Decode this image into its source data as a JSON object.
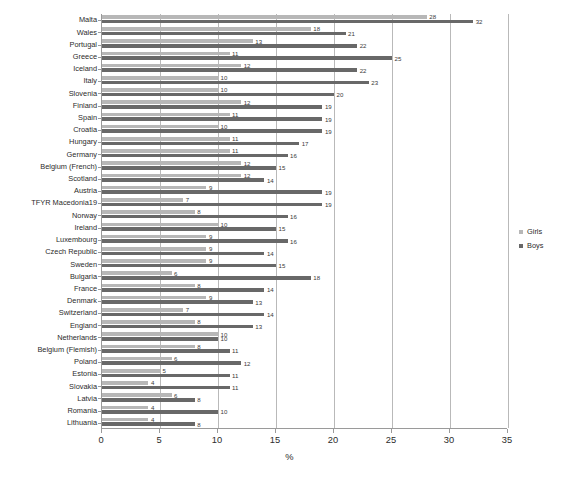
{
  "chart_data": {
    "type": "bar",
    "orientation": "horizontal",
    "title": "",
    "xlabel": "%",
    "ylabel": "",
    "xlim": [
      0,
      35
    ],
    "xticks": [
      0,
      5,
      10,
      15,
      20,
      25,
      30,
      35
    ],
    "grid": true,
    "legend_position": "right",
    "legend": [
      "Girls",
      "Boys"
    ],
    "categories": [
      "Malta",
      "Wales",
      "Portugal",
      "Greece",
      "Iceland",
      "Italy",
      "Slovenia",
      "Finland",
      "Spain",
      "Croatia",
      "Hungary",
      "Germany",
      "Belgium (French)",
      "Scotland",
      "Austria",
      "TFYR Macedonia19",
      "Norway",
      "Ireland",
      "Luxembourg",
      "Czech Republic",
      "Sweden",
      "Bulgaria",
      "France",
      "Denmark",
      "Switzerland",
      "England",
      "Netherlands",
      "Belgium (Flemish)",
      "Poland",
      "Estonia",
      "Slovakia",
      "Latvia",
      "Romania",
      "Lithuania"
    ],
    "series": [
      {
        "name": "Girls",
        "color": "#b7b7b7",
        "values": [
          28,
          18,
          13,
          11,
          12,
          10,
          10,
          12,
          11,
          10,
          11,
          11,
          12,
          12,
          9,
          7,
          8,
          10,
          9,
          9,
          9,
          6,
          8,
          9,
          7,
          8,
          10,
          8,
          6,
          5,
          4,
          6,
          4,
          4
        ]
      },
      {
        "name": "Boys",
        "color": "#686868",
        "values": [
          32,
          21,
          22,
          25,
          22,
          23,
          20,
          19,
          19,
          19,
          17,
          16,
          15,
          14,
          19,
          19,
          16,
          15,
          16,
          14,
          15,
          18,
          14,
          13,
          14,
          13,
          10,
          11,
          12,
          11,
          11,
          8,
          10,
          8
        ]
      }
    ]
  }
}
